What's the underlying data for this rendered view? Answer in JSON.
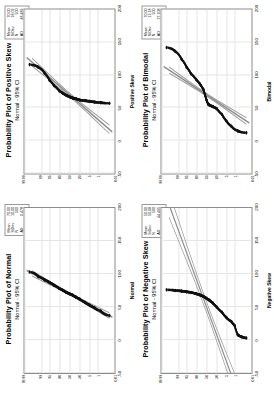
{
  "figure": {
    "layout": "2x2 grid of Minitab probability plots, each rotated 90 degrees counter-clockwise",
    "axis_label_percent": "Percent",
    "percent_ticks": [
      "99.99",
      "99",
      "95",
      "80",
      "50",
      "20",
      "5",
      "1",
      "0.01"
    ],
    "x_ticks": [
      "-50",
      "0",
      "50",
      "100",
      "150",
      "200"
    ],
    "colors": {
      "data": "#111111",
      "fit_line": "#8c8c8c",
      "ci_band": "#9b9b9b",
      "grid": "#e6e6e6",
      "frame": "#8c8c8c"
    }
  },
  "panels": [
    {
      "id": "positive-skew",
      "title": "Probability Plot of Positive Skew",
      "subtitle": "Normal - 95% CI",
      "xlabel": "Positive Skew",
      "ylabel": "Percent",
      "stats": [
        {
          "key": "Mean",
          "value": "70.00"
        },
        {
          "key": "StDev",
          "value": "16.02"
        },
        {
          "key": "N",
          "value": "500"
        },
        {
          "key": "AD",
          "value": "46.489"
        },
        {
          "key": "P-Value",
          "value": "<0.005"
        }
      ]
    },
    {
      "id": "bimodal",
      "title": "Probability Plot of Bimodal",
      "subtitle": "Normal - 95% CI",
      "xlabel": "Bimodal",
      "ylabel": "Percent",
      "stats": [
        {
          "key": "Mean",
          "value": "70.00"
        },
        {
          "key": "StDev",
          "value": "12.18"
        },
        {
          "key": "N",
          "value": "500"
        },
        {
          "key": "AD",
          "value": "27.108"
        },
        {
          "key": "P-Value",
          "value": "<0.005"
        }
      ]
    },
    {
      "id": "normal",
      "title": "Probability Plot of Normal",
      "subtitle": "Normal - 95% CI",
      "xlabel": "Normal",
      "ylabel": "Percent",
      "stats": [
        {
          "key": "Mean",
          "value": "70.00"
        },
        {
          "key": "StDev",
          "value": "10.00"
        },
        {
          "key": "N",
          "value": "500"
        },
        {
          "key": "AD",
          "value": "0.478"
        },
        {
          "key": "P-Value",
          "value": "0.519"
        }
      ]
    },
    {
      "id": "negative-skew",
      "title": "Probability Plot of Negative Skew",
      "subtitle": "Normal - 95% CI",
      "xlabel": "Negative Skew",
      "ylabel": "Percent",
      "stats": [
        {
          "key": "Mean",
          "value": "50.00"
        },
        {
          "key": "StDev",
          "value": "50.08"
        },
        {
          "key": "N",
          "value": "500"
        },
        {
          "key": "AD",
          "value": "44.495"
        },
        {
          "key": "P-Value",
          "value": "<0.005"
        }
      ]
    }
  ],
  "chart_data": {
    "type": "scatter",
    "xlabel": "Value",
    "ylabel": "Percent",
    "xlim": [
      -50,
      200
    ],
    "ylim_percent": [
      0.01,
      99.99
    ],
    "grid": true,
    "legend": "stat box per panel",
    "series": [
      {
        "name": "Positive Skew",
        "percent": [
          0.05,
          0.5,
          2,
          5,
          10,
          20,
          30,
          40,
          50,
          60,
          70,
          80,
          90,
          95,
          98,
          99.5,
          99.95
        ],
        "values": [
          57,
          58,
          59,
          60,
          61,
          62,
          64,
          65,
          67,
          69,
          72,
          76,
          84,
          92,
          103,
          112,
          116
        ],
        "fit_line": {
          "x": [
            -50,
            200
          ],
          "percent": [
            0.01,
            99.99
          ]
        }
      },
      {
        "name": "Bimodal",
        "percent": [
          0.05,
          0.5,
          2,
          5,
          10,
          20,
          30,
          40,
          45,
          50,
          55,
          60,
          70,
          80,
          90,
          95,
          98,
          99.5,
          99.95
        ],
        "values": [
          12,
          15,
          22,
          30,
          40,
          49,
          52,
          54,
          56,
          62,
          70,
          78,
          86,
          93,
          102,
          112,
          124,
          136,
          142
        ],
        "fit_line": {
          "x": [
            -50,
            200
          ],
          "percent": [
            0.01,
            99.99
          ]
        }
      },
      {
        "name": "Normal",
        "percent": [
          0.05,
          0.5,
          2,
          5,
          10,
          20,
          30,
          40,
          50,
          60,
          70,
          80,
          90,
          95,
          98,
          99.5,
          99.95
        ],
        "values": [
          37,
          44,
          49,
          53,
          57,
          62,
          65,
          68,
          70,
          72,
          75,
          78,
          83,
          87,
          91,
          96,
          103
        ],
        "fit_line": {
          "x": [
            -50,
            200
          ],
          "percent": [
            0.01,
            99.99
          ]
        }
      },
      {
        "name": "Negative Skew",
        "percent": [
          0.05,
          0.2,
          0.5,
          1,
          2,
          5,
          10,
          20,
          30,
          40,
          50,
          60,
          70,
          80,
          90,
          95,
          98,
          99.5,
          99.95
        ],
        "values": [
          3,
          5,
          8,
          22,
          28,
          34,
          42,
          50,
          56,
          60,
          63,
          66,
          68,
          70,
          72,
          73,
          74,
          75,
          76
        ],
        "fit_line": {
          "x": [
            -50,
            200
          ],
          "percent": [
            0.01,
            99.99
          ]
        }
      }
    ]
  }
}
